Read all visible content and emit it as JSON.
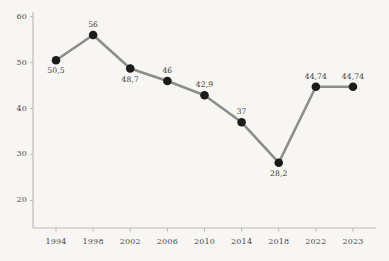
{
  "chart_data": {
    "type": "line",
    "title": "",
    "subtitle": "",
    "xlabel": "",
    "ylabel": "",
    "categories": [
      "1994",
      "1998",
      "2002",
      "2006",
      "2010",
      "2014",
      "2018",
      "2022",
      "2023"
    ],
    "values": [
      50.5,
      56,
      48.7,
      46,
      42.9,
      37,
      28.2,
      44.74,
      44.74
    ],
    "value_labels": [
      "50,5",
      "56",
      "48,7",
      "46",
      "42,9",
      "37",
      "28,2",
      "44,74",
      "44,74"
    ],
    "label_positions": [
      "below",
      "above",
      "below",
      "above",
      "above",
      "above",
      "below",
      "above",
      "above"
    ],
    "ytick_labels": [
      "20",
      "30",
      "40",
      "50",
      "60"
    ],
    "ytick_values": [
      20,
      30,
      40,
      50,
      60
    ],
    "ylim": [
      14,
      61
    ],
    "xlim": [
      -0.55,
      8.55
    ],
    "grid": false,
    "legend": false,
    "legend_position": "none",
    "decimal_separator": ",",
    "series": [
      {
        "name": "series-1",
        "values": [
          50.5,
          56,
          48.7,
          46,
          42.9,
          37,
          28.2,
          44.74,
          44.74
        ]
      }
    ]
  },
  "style": {
    "background_color": "#f7f6f3",
    "line_color": "#8d8d8d",
    "marker_color": "#1b1b1b",
    "axis_color": "#b9b7b4",
    "text_color": "#4a4a4a",
    "value_text_color": "#3a3a3a"
  }
}
